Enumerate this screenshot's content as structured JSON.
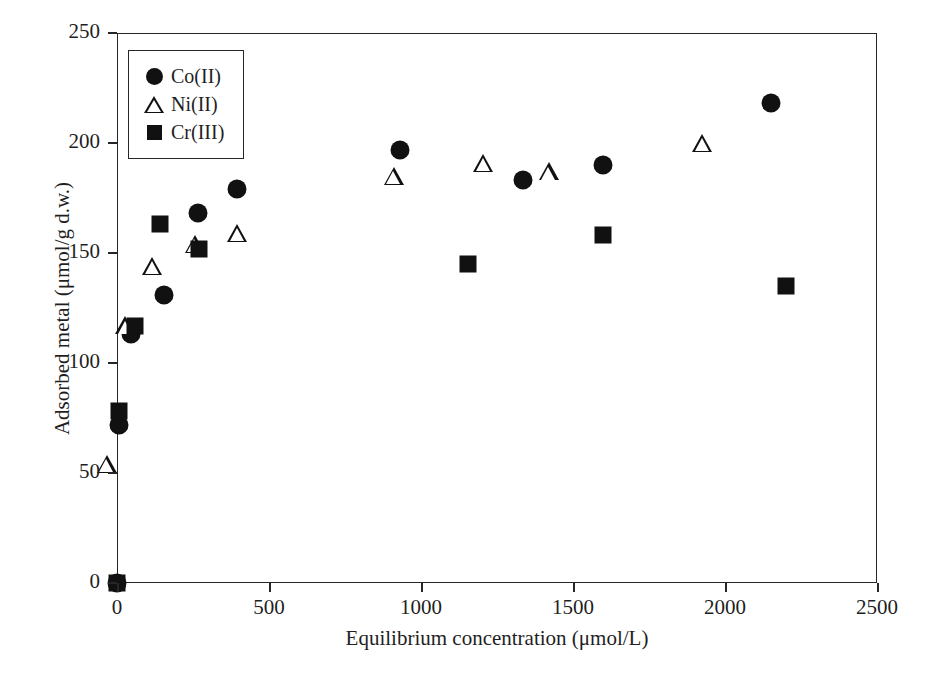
{
  "chart_data": {
    "type": "scatter",
    "title": "",
    "xlabel": "Equilibrium concentration (μmol/L)",
    "ylabel": "Adsorbed metal (μmol/g d.w.)",
    "xlim": [
      0,
      2500
    ],
    "ylim": [
      0,
      250
    ],
    "xticks": [
      0,
      500,
      1000,
      1500,
      2000,
      2500
    ],
    "yticks": [
      0,
      50,
      100,
      150,
      200,
      250
    ],
    "xtick_labels": [
      "0",
      "500",
      "1000",
      "1500",
      "2000",
      "2500"
    ],
    "ytick_labels": [
      "0",
      "50",
      "100",
      "150",
      "200",
      "250"
    ],
    "grid": false,
    "legend_position": "upper left",
    "series": [
      {
        "name": "Co(II)",
        "marker": "filled-circle",
        "color": "#111111",
        "points": [
          [
            0,
            0
          ],
          [
            5,
            72
          ],
          [
            45,
            113
          ],
          [
            155,
            131
          ],
          [
            265,
            168
          ],
          [
            395,
            179
          ],
          [
            930,
            197
          ],
          [
            1335,
            183
          ],
          [
            1600,
            190
          ],
          [
            2150,
            218
          ]
        ]
      },
      {
        "name": "Ni(II)",
        "marker": "open-triangle",
        "color": "#111111",
        "points": [
          [
            0,
            50
          ],
          [
            62,
            113
          ],
          [
            150,
            140
          ],
          [
            290,
            150
          ],
          [
            430,
            155
          ],
          [
            945,
            181
          ],
          [
            1240,
            187
          ],
          [
            1455,
            183
          ],
          [
            1960,
            196
          ]
        ]
      },
      {
        "name": "Cr(III)",
        "marker": "filled-square",
        "color": "#111111",
        "points": [
          [
            0,
            0
          ],
          [
            8,
            78
          ],
          [
            60,
            117
          ],
          [
            140,
            163
          ],
          [
            270,
            152
          ],
          [
            1155,
            145
          ],
          [
            1600,
            158
          ],
          [
            2200,
            135
          ]
        ]
      }
    ]
  },
  "legend": {
    "entries": [
      {
        "label": "Co(II)",
        "marker": "filled-circle"
      },
      {
        "label": "Ni(II)",
        "marker": "open-triangle"
      },
      {
        "label": "Cr(III)",
        "marker": "filled-square"
      }
    ]
  },
  "axes": {
    "x_title": "Equilibrium concentration (μmol/L)",
    "y_title": "Adsorbed metal (μmol/g d.w.)"
  }
}
